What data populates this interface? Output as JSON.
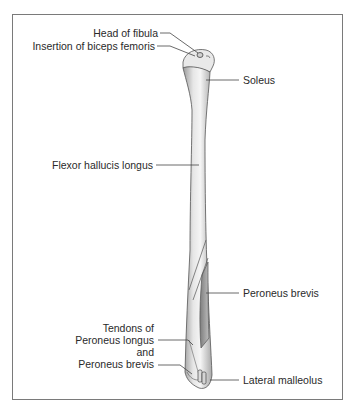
{
  "figure": {
    "labels_left": [
      {
        "id": "head-of-fibula",
        "text": "Head of fibula"
      },
      {
        "id": "insertion-biceps-femoris",
        "text": "Insertion of biceps femoris"
      },
      {
        "id": "flexor-hallucis-longus",
        "text": "Flexor hallucis longus"
      },
      {
        "id": "tendons-peroneus",
        "lines": [
          "Tendons of",
          "Peroneus longus",
          "and",
          "Peroneus brevis"
        ]
      }
    ],
    "labels_right": [
      {
        "id": "soleus",
        "text": "Soleus"
      },
      {
        "id": "peroneus-brevis",
        "text": "Peroneus brevis"
      },
      {
        "id": "lateral-malleolus",
        "text": "Lateral malleolus"
      }
    ],
    "colors": {
      "frame": "#7a7a7a",
      "bone_light": "#f2f2f2",
      "bone_mid": "#c8c8c8",
      "bone_dark": "#8c8c8c",
      "outline": "#555555",
      "leader": "#444444",
      "text": "#2a2a2a"
    }
  }
}
